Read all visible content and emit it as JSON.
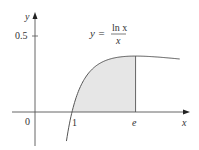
{
  "chart_data": {
    "type": "line",
    "title": "",
    "function_label": {
      "lhs": "y =",
      "numerator": "ln x",
      "denominator": "x"
    },
    "xlabel": "x",
    "ylabel": "y",
    "x_ticks": [
      {
        "value": 0,
        "label": "0"
      },
      {
        "value": 1,
        "label": "1"
      },
      {
        "value": 2.718,
        "label": "e"
      }
    ],
    "y_ticks": [
      {
        "value": 0.5,
        "label": "0.5"
      }
    ],
    "series": [
      {
        "name": "y = ln x / x",
        "x": [
          0.85,
          0.9,
          1.0,
          1.2,
          1.5,
          2.0,
          2.5,
          2.718,
          3.0,
          3.5,
          3.9
        ],
        "values": [
          -0.191,
          -0.117,
          0.0,
          0.152,
          0.27,
          0.347,
          0.367,
          0.368,
          0.366,
          0.358,
          0.349
        ]
      }
    ],
    "shaded_region": {
      "from": 1,
      "to": 2.718,
      "color": "#e6e6e6"
    },
    "xlim": [
      -0.6,
      4.2
    ],
    "ylim": [
      -0.2,
      0.65
    ],
    "grid": false,
    "legend": "none"
  },
  "colors": {
    "axis": "#555555",
    "curve": "#555555",
    "shade": "#e6e6e6"
  }
}
